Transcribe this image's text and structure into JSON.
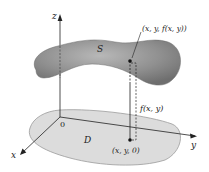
{
  "diagram": {
    "axes": {
      "x_label": "x",
      "y_label": "y",
      "z_label": "z",
      "origin_label": "0"
    },
    "surface": {
      "label": "S",
      "color": "#8a8a8a"
    },
    "region": {
      "label": "D",
      "color": "#d9d9d9"
    },
    "surface_point": {
      "label": "(x, y, f(x, y))"
    },
    "height": {
      "label": "f(x, y)"
    },
    "base_point": {
      "label": "(x, y, 0)"
    }
  }
}
